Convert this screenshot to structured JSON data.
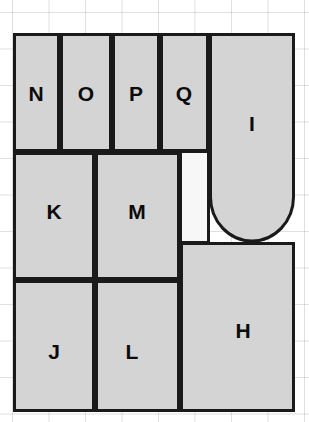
{
  "canvas": {
    "width": 309,
    "height": 422,
    "background_color": "#ffffff",
    "grid_color": "#969696",
    "grid_spacing_px": 36.5
  },
  "style": {
    "room_fill": "#d4d4d4",
    "void_fill": "#f7f7f7",
    "outline_color": "#1a1a1a",
    "outline_width_px": 3,
    "label_color": "#0b0b0b"
  },
  "diagram": {
    "type": "floor-plan",
    "room_count": 10,
    "labels": [
      "N",
      "O",
      "P",
      "Q",
      "I",
      "K",
      "M",
      "J",
      "L",
      "H"
    ]
  },
  "rooms": [
    {
      "id": "N",
      "label": "N",
      "shape": "rect",
      "x": 13,
      "y": 33,
      "width": 47,
      "height": 119,
      "label_x": 36,
      "label_y": 93,
      "fill": "#d4d4d4"
    },
    {
      "id": "O",
      "label": "O",
      "shape": "rect",
      "x": 60,
      "y": 33,
      "width": 52,
      "height": 119,
      "label_x": 86,
      "label_y": 93,
      "fill": "#d4d4d4"
    },
    {
      "id": "P",
      "label": "P",
      "shape": "rect",
      "x": 112,
      "y": 33,
      "width": 48,
      "height": 119,
      "label_x": 136,
      "label_y": 93,
      "fill": "#d4d4d4"
    },
    {
      "id": "Q",
      "label": "Q",
      "shape": "rect",
      "x": 160,
      "y": 33,
      "width": 49,
      "height": 119,
      "label_x": 184,
      "label_y": 93,
      "fill": "#d4d4d4"
    },
    {
      "id": "I",
      "label": "I",
      "shape": "round-bottom-rect",
      "x": 209,
      "y": 33,
      "width": 86,
      "height": 209,
      "label_x": 252,
      "label_y": 123,
      "fill": "#d4d4d4",
      "note": "bottom edge is a semicircular arc bulging downward"
    },
    {
      "id": "K",
      "label": "K",
      "shape": "rect",
      "x": 13,
      "y": 152,
      "width": 82,
      "height": 128,
      "label_x": 54,
      "label_y": 211,
      "fill": "#d4d4d4"
    },
    {
      "id": "M",
      "label": "M",
      "shape": "rect",
      "x": 95,
      "y": 152,
      "width": 85,
      "height": 128,
      "label_x": 137,
      "label_y": 211,
      "fill": "#d4d4d4"
    },
    {
      "id": "J",
      "label": "J",
      "shape": "rect",
      "x": 13,
      "y": 280,
      "width": 82,
      "height": 132,
      "label_x": 54,
      "label_y": 351,
      "fill": "#d4d4d4"
    },
    {
      "id": "L",
      "label": "L",
      "shape": "rect",
      "x": 95,
      "y": 280,
      "width": 85,
      "height": 132,
      "label_x": 132,
      "label_y": 351,
      "fill": "#d4d4d4"
    },
    {
      "id": "H",
      "label": "H",
      "shape": "rect",
      "x": 180,
      "y": 242,
      "width": 115,
      "height": 170,
      "label_x": 243,
      "label_y": 330,
      "fill": "#d4d4d4"
    }
  ],
  "voids": [
    {
      "id": "light-well",
      "shape": "rect",
      "x": 180,
      "y": 152,
      "width": 29,
      "height": 90,
      "fill": "#f7f7f7",
      "note": "unfilled notch between M, Q and I"
    }
  ]
}
